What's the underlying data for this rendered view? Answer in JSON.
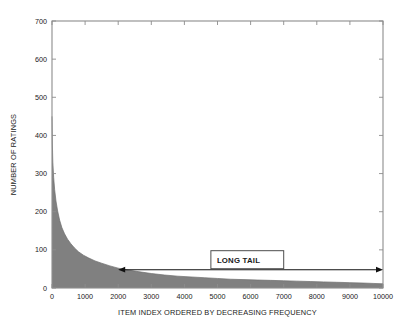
{
  "chart_data": {
    "type": "area",
    "title": "",
    "subtitle": "",
    "xlabel": "ITEM INDEX ORDERED BY DECREASING FREQUENCY",
    "ylabel": "NUMBER OF RATINGS",
    "xlim": [
      0,
      10000
    ],
    "ylim": [
      0,
      700
    ],
    "grid": false,
    "legend": "none",
    "fill_color": "#808080",
    "line_color": "#6e6e6e",
    "axis_color": "#8c8c8c",
    "background": "#ffffff",
    "xticks": [
      0,
      1000,
      2000,
      3000,
      4000,
      5000,
      6000,
      7000,
      8000,
      9000,
      10000
    ],
    "xticklabels": [
      "0",
      "1000",
      "2000",
      "3000",
      "4000",
      "5000",
      "6000",
      "7000",
      "8000",
      "9000",
      "10000"
    ],
    "yticks": [
      0,
      100,
      200,
      300,
      400,
      500,
      600,
      700
    ],
    "yticklabels": [
      "0",
      "100",
      "200",
      "300",
      "400",
      "500",
      "600",
      "700"
    ],
    "series": [
      {
        "name": "Number of ratings per item",
        "x": [
          1,
          10,
          25,
          50,
          80,
          120,
          170,
          230,
          300,
          380,
          470,
          570,
          680,
          800,
          950,
          1100,
          1300,
          1500,
          1750,
          2000,
          2300,
          2600,
          3000,
          3400,
          3800,
          4200,
          4600,
          5000,
          5400,
          5800,
          6200,
          6600,
          7000,
          7400,
          7800,
          8200,
          8600,
          9000,
          9400,
          9700,
          10000
        ],
        "values": [
          450,
          380,
          330,
          290,
          258,
          228,
          202,
          178,
          158,
          142,
          128,
          116,
          105,
          95,
          86,
          79,
          71,
          65,
          58,
          52,
          47,
          43,
          38,
          34,
          31,
          29,
          27,
          25,
          23,
          22,
          21,
          20,
          19,
          18,
          17,
          16,
          15,
          14,
          13,
          12,
          11
        ]
      }
    ],
    "annotations": [
      {
        "name": "long-tail",
        "label": "LONG TAIL",
        "type": "double-arrow-with-label",
        "x_start": 2000,
        "x_end": 10000,
        "y": 48,
        "box_x_start": 4800,
        "box_x_end": 7000
      }
    ]
  },
  "chart": {
    "xlabel": "ITEM INDEX ORDERED BY DECREASING FREQUENCY",
    "ylabel": "NUMBER OF RATINGS",
    "annotation_label": "LONG TAIL",
    "xticklabels": [
      "0",
      "1000",
      "2000",
      "3000",
      "4000",
      "5000",
      "6000",
      "7000",
      "8000",
      "9000",
      "10000"
    ],
    "yticklabels": [
      "0",
      "100",
      "200",
      "300",
      "400",
      "500",
      "600",
      "700"
    ]
  }
}
